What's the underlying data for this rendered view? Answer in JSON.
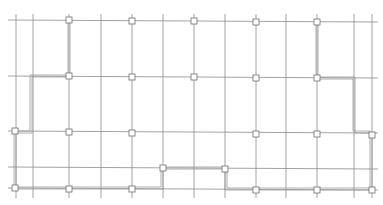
{
  "drawing": {
    "type": "floor-plan-grid",
    "colors": {
      "grid_line": "#8a8a8a",
      "wall_line": "#9a9a9a",
      "column_marker": "#6e6e6e",
      "background": "#ffffff"
    },
    "vertical_axes_x": [
      16,
      33,
      69,
      101,
      132,
      163,
      194,
      225,
      256,
      286,
      317,
      354,
      372
    ],
    "horizontal_axes_y": [
      20,
      76,
      132,
      168,
      189
    ],
    "column_markers": [
      {
        "x": 69,
        "y": 20
      },
      {
        "x": 132,
        "y": 20
      },
      {
        "x": 194,
        "y": 20
      },
      {
        "x": 256,
        "y": 20
      },
      {
        "x": 317,
        "y": 20
      },
      {
        "x": 69,
        "y": 76
      },
      {
        "x": 132,
        "y": 76
      },
      {
        "x": 194,
        "y": 76
      },
      {
        "x": 256,
        "y": 76
      },
      {
        "x": 317,
        "y": 76
      },
      {
        "x": 15,
        "y": 132
      },
      {
        "x": 69,
        "y": 132
      },
      {
        "x": 132,
        "y": 132
      },
      {
        "x": 256,
        "y": 132
      },
      {
        "x": 317,
        "y": 132
      },
      {
        "x": 372,
        "y": 132
      },
      {
        "x": 163,
        "y": 168
      },
      {
        "x": 225,
        "y": 168
      },
      {
        "x": 15,
        "y": 189
      },
      {
        "x": 69,
        "y": 189
      },
      {
        "x": 132,
        "y": 189
      },
      {
        "x": 256,
        "y": 189
      },
      {
        "x": 317,
        "y": 189
      },
      {
        "x": 372,
        "y": 189
      }
    ],
    "wall_outline": [
      [
        69,
        20
      ],
      [
        69,
        76
      ],
      [
        31,
        76
      ],
      [
        31,
        132
      ],
      [
        15,
        132
      ],
      [
        15,
        189
      ],
      [
        69,
        189
      ],
      [
        69,
        188
      ],
      [
        132,
        188
      ],
      [
        163,
        188
      ],
      [
        163,
        168
      ],
      [
        225,
        168
      ],
      [
        225,
        189
      ],
      [
        317,
        189
      ],
      [
        372,
        189
      ],
      [
        372,
        132
      ],
      [
        354,
        132
      ],
      [
        354,
        76
      ],
      [
        317,
        76
      ],
      [
        317,
        20
      ]
    ]
  }
}
